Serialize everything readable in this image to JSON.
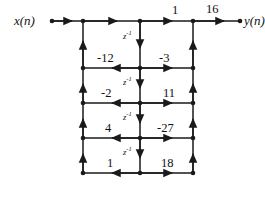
{
  "figure": {
    "type": "signal-flow-graph",
    "line_color": "#1a1a1a",
    "background_color": "#ffffff"
  },
  "io": {
    "input_label": "x(n)",
    "output_label": "y(n)"
  },
  "top_row": {
    "gain_mid_to_right": "1",
    "gain_right_to_output": "16"
  },
  "delays": {
    "label": "z",
    "exponent": "-1",
    "count": 4,
    "items": [
      {
        "label": "z",
        "exponent": "-1"
      },
      {
        "label": "z",
        "exponent": "-1"
      },
      {
        "label": "z",
        "exponent": "-1"
      },
      {
        "label": "z",
        "exponent": "-1"
      }
    ]
  },
  "stages": [
    {
      "index": 1,
      "reflection_gain": "-12",
      "ladder_gain": "-3"
    },
    {
      "index": 2,
      "reflection_gain": "-2",
      "ladder_gain": "11"
    },
    {
      "index": 3,
      "reflection_gain": "4",
      "ladder_gain": "-27"
    },
    {
      "index": 4,
      "reflection_gain": "1",
      "ladder_gain": "18"
    }
  ],
  "geometry": {
    "col_left_x": 83,
    "col_mid_x": 140,
    "col_right_x": 193,
    "row_ys": [
      21,
      68,
      103,
      138,
      173
    ],
    "input_node_x": 52,
    "output_node_x": 240
  }
}
